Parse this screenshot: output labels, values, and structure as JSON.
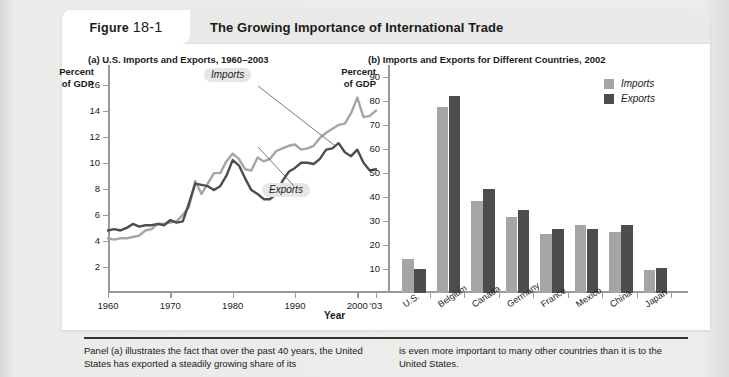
{
  "figure": {
    "tag_prefix": "Figure",
    "tag_number": "18-1",
    "title": "The Growing Importance of International Trade"
  },
  "panel_a": {
    "title": "(a) U.S. Imports and Exports, 1960–2003",
    "axis_caption": "Percent\nof GDP",
    "axis_caption_line1": "Percent",
    "axis_caption_line2": "of GDP",
    "x_axis_name": "Year",
    "callout_imports": "Imports",
    "callout_exports": "Exports"
  },
  "panel_b": {
    "title": "(b) Imports and Exports for Different Countries, 2002",
    "axis_caption_line1": "Percent",
    "axis_caption_line2": "of GDP",
    "legend": [
      {
        "label": "Imports",
        "color": "#a5a5a3"
      },
      {
        "label": "Exports",
        "color": "#4d4d4d"
      }
    ]
  },
  "caption": {
    "left": "Panel (a) illustrates the fact that over the past 40 years, the United States has exported a steadily growing share of its",
    "right": "is even more important to many other countries than it is to the United States."
  },
  "colors": {
    "imports": "#a5a5a3",
    "exports": "#4d4d4d",
    "axis": "#9a9a9a",
    "card": "#ffffff",
    "header": "#e9e9e7",
    "page": "#eaeae8"
  },
  "chart_data": [
    {
      "type": "line",
      "title": "(a) U.S. Imports and Exports, 1960–2003",
      "xlabel": "Year",
      "ylabel": "Percent of GDP",
      "xlim": [
        1960,
        2003
      ],
      "ylim": [
        0,
        17.5
      ],
      "yticks": [
        2,
        4,
        6,
        8,
        10,
        12,
        14,
        16
      ],
      "xticks": [
        1960,
        1970,
        1980,
        1990,
        2000,
        2003
      ],
      "xticklabels": [
        "1960",
        "1970",
        "1980",
        "1990",
        "2000",
        "'03"
      ],
      "grid": false,
      "legend": "annotations",
      "annotations": [
        "Imports",
        "Exports"
      ],
      "x": [
        1960,
        1961,
        1962,
        1963,
        1964,
        1965,
        1966,
        1967,
        1968,
        1969,
        1970,
        1971,
        1972,
        1973,
        1974,
        1975,
        1976,
        1977,
        1978,
        1979,
        1980,
        1981,
        1982,
        1983,
        1984,
        1985,
        1986,
        1987,
        1988,
        1989,
        1990,
        1991,
        1992,
        1993,
        1994,
        1995,
        1996,
        1997,
        1998,
        1999,
        2000,
        2001,
        2002,
        2003
      ],
      "series": [
        {
          "name": "Imports",
          "color": "#a5a5a3",
          "values": [
            4.2,
            4.1,
            4.2,
            4.2,
            4.3,
            4.4,
            4.8,
            4.9,
            5.3,
            5.3,
            5.4,
            5.5,
            6.0,
            6.6,
            8.6,
            7.6,
            8.4,
            9.2,
            9.2,
            10.1,
            10.7,
            10.3,
            9.5,
            9.4,
            10.4,
            10.1,
            10.3,
            10.9,
            11.1,
            11.3,
            11.4,
            11.0,
            11.1,
            11.3,
            11.9,
            12.3,
            12.6,
            12.9,
            13.0,
            13.8,
            15.0,
            13.5,
            13.6,
            14.0
          ]
        },
        {
          "name": "Exports",
          "color": "#4d4d4d",
          "values": [
            4.8,
            4.9,
            4.8,
            5.0,
            5.3,
            5.1,
            5.2,
            5.2,
            5.3,
            5.2,
            5.6,
            5.4,
            5.5,
            6.9,
            8.4,
            8.3,
            8.2,
            7.9,
            8.2,
            9.0,
            10.2,
            9.8,
            8.8,
            7.9,
            7.6,
            7.2,
            7.2,
            7.6,
            8.6,
            9.3,
            9.6,
            10.0,
            10.0,
            9.9,
            10.3,
            11.0,
            11.1,
            11.5,
            10.8,
            10.5,
            11.0,
            10.0,
            9.4,
            9.5
          ]
        }
      ]
    },
    {
      "type": "bar",
      "title": "(b) Imports and Exports for Different Countries, 2002",
      "xlabel": "",
      "ylabel": "Percent of GDP",
      "ylim": [
        0,
        95
      ],
      "yticks": [
        10,
        20,
        30,
        40,
        50,
        60,
        70,
        80,
        90
      ],
      "grid": false,
      "legend": "top-right",
      "categories": [
        "U.S.",
        "Belgium",
        "Canada",
        "Germany",
        "France",
        "Mexico",
        "China",
        "Japan"
      ],
      "series": [
        {
          "name": "Imports",
          "color": "#a5a5a3",
          "values": [
            14.0,
            77.5,
            38.5,
            31.5,
            24.5,
            28.5,
            25.5,
            9.5
          ]
        },
        {
          "name": "Exports",
          "color": "#4d4d4d",
          "values": [
            10.0,
            82.0,
            43.5,
            34.5,
            26.5,
            26.5,
            28.5,
            10.5
          ]
        }
      ]
    }
  ]
}
